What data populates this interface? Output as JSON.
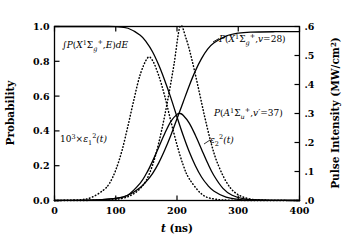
{
  "chart_data": {
    "type": "line",
    "title": "",
    "xlabel": "t (ns)",
    "ylabel": "Probability",
    "y2label": "Pulse Intensity (MW/cm²)",
    "xlim": [
      0,
      400
    ],
    "ylim": [
      0.0,
      1.0
    ],
    "y2lim": [
      0.0,
      0.6
    ],
    "grid": false,
    "legend_position": "inline-annotations",
    "xticks": [
      0,
      100,
      200,
      300,
      400
    ],
    "xticklabels": [
      "0",
      "100",
      "200",
      "300",
      "400"
    ],
    "yticks": [
      0.0,
      0.2,
      0.4,
      0.6,
      0.8,
      1.0
    ],
    "yticklabels": [
      "0.0",
      "0.2",
      "0.4",
      "0.6",
      "0.8",
      "1.0"
    ],
    "y2ticks": [
      0.0,
      0.1,
      0.2,
      0.3,
      0.4,
      0.5,
      0.6
    ],
    "y2ticklabels": [
      ".0",
      ".1",
      ".2",
      ".3",
      ".4",
      ".5",
      ".6"
    ],
    "series": [
      {
        "name": "integral-P-X-E-dE",
        "label_text": "∫P(X¹Σg⁺,E)dE",
        "style": "solid",
        "axis": "left",
        "description": "Starts at 1.0, decays sigmoidally to ~0 near 300 ns",
        "x": [
          0,
          20,
          40,
          60,
          80,
          100,
          120,
          140,
          150,
          160,
          170,
          180,
          190,
          200,
          210,
          220,
          230,
          240,
          250,
          260,
          280,
          300,
          320,
          360,
          400
        ],
        "y": [
          1.0,
          1.0,
          1.0,
          1.0,
          1.0,
          0.999,
          0.99,
          0.95,
          0.91,
          0.855,
          0.78,
          0.69,
          0.59,
          0.48,
          0.375,
          0.28,
          0.2,
          0.135,
          0.088,
          0.055,
          0.019,
          0.007,
          0.003,
          0.001,
          0.0
        ]
      },
      {
        "name": "P-X-v28",
        "label_text": "P(X¹Σg⁺,v=28)",
        "style": "solid",
        "axis": "left",
        "description": "Sigmoidal rise from 0 to ~0.97 plateau after 300 ns",
        "x": [
          0,
          60,
          100,
          120,
          140,
          150,
          160,
          170,
          180,
          190,
          200,
          210,
          220,
          230,
          240,
          250,
          260,
          280,
          300,
          320,
          360,
          400
        ],
        "y": [
          0.0,
          0.002,
          0.012,
          0.03,
          0.075,
          0.11,
          0.155,
          0.215,
          0.29,
          0.375,
          0.47,
          0.565,
          0.66,
          0.745,
          0.815,
          0.87,
          0.905,
          0.945,
          0.962,
          0.968,
          0.97,
          0.97
        ]
      },
      {
        "name": "P-A-v37",
        "label_text": "P(A¹Σᵤ⁺,v'=37)",
        "style": "solid",
        "axis": "left",
        "description": "Transient population: rises to ~0.50 peak near 205 ns then decays to 0",
        "x": [
          0,
          60,
          100,
          120,
          140,
          150,
          160,
          170,
          180,
          190,
          200,
          205,
          210,
          220,
          230,
          240,
          250,
          260,
          275,
          290,
          310,
          340,
          400
        ],
        "y": [
          0.0,
          0.002,
          0.012,
          0.032,
          0.1,
          0.155,
          0.225,
          0.305,
          0.385,
          0.455,
          0.495,
          0.5,
          0.49,
          0.445,
          0.375,
          0.295,
          0.215,
          0.145,
          0.07,
          0.03,
          0.009,
          0.002,
          0.0
        ]
      },
      {
        "name": "epsilon1-squared-pulse",
        "label_text": "10³×ε₁²(t)",
        "style": "dotted",
        "axis": "left",
        "description": "First laser pulse, peak 0.82 at ~152 ns",
        "peak_x": 152,
        "peak_y": 0.82,
        "x": [
          0,
          40,
          60,
          80,
          90,
          100,
          110,
          120,
          130,
          140,
          152,
          160,
          170,
          180,
          190,
          200,
          210,
          220,
          240,
          260,
          300,
          400
        ],
        "y": [
          0.0,
          0.004,
          0.017,
          0.06,
          0.1,
          0.175,
          0.285,
          0.43,
          0.585,
          0.725,
          0.82,
          0.805,
          0.72,
          0.6,
          0.455,
          0.32,
          0.205,
          0.125,
          0.038,
          0.009,
          0.001,
          0.0
        ]
      },
      {
        "name": "epsilon2-squared-pulse",
        "label_text": "ε₂²(t)",
        "style": "dotted",
        "axis": "left",
        "description": "Second laser pulse, peak 1.00 at ~205 ns",
        "peak_x": 205,
        "peak_y": 1.0,
        "x": [
          0,
          80,
          110,
          130,
          145,
          155,
          165,
          175,
          185,
          195,
          205,
          215,
          225,
          235,
          245,
          255,
          265,
          280,
          295,
          315,
          340,
          400
        ],
        "y": [
          0.0,
          0.002,
          0.012,
          0.04,
          0.09,
          0.155,
          0.26,
          0.405,
          0.58,
          0.78,
          1.0,
          0.93,
          0.8,
          0.645,
          0.485,
          0.34,
          0.225,
          0.11,
          0.045,
          0.012,
          0.003,
          0.0
        ]
      }
    ],
    "annotations": [
      {
        "name": "integral-P-X-E-dE",
        "x": 105,
        "y": 0.93
      },
      {
        "name": "P-X-v28",
        "x": 272,
        "y": 0.93
      },
      {
        "name": "P-A-v37",
        "x": 300,
        "y": 0.58
      },
      {
        "name": "epsilon1-squared",
        "x": 72,
        "y": 0.4
      },
      {
        "name": "epsilon2-squared",
        "x": 235,
        "y": 0.38
      }
    ]
  },
  "labels": {
    "ylabel": "Probability",
    "y2label_text": "Pulse Intensity (MW/cm",
    "y2label_sup": "2",
    "y2label_close": ")",
    "xlabel_italic": "t",
    "xlabel_rest": " (ns)"
  },
  "annotation_text": {
    "integral": {
      "integral_sign": "∫",
      "p": "P",
      "paren_open": "(",
      "x": "X",
      "sup1": "1",
      "sigma": "Σ",
      "sub_g": "g",
      "sup_plus": "+",
      "comma": ",",
      "e": "E",
      "paren_close": ")",
      "de_d": "d",
      "de_e": "E"
    },
    "x_v28": {
      "p": "P",
      "paren_open": "(",
      "x": "X",
      "sup1": "1",
      "sigma": "Σ",
      "sub_g": "g",
      "sup_plus": "+",
      "comma": ",",
      "v": "v",
      "eq": "=28",
      "paren_close": ")"
    },
    "a_v37": {
      "p": "P",
      "paren_open": "(",
      "a": "A",
      "sup1": "1",
      "sigma": "Σ",
      "sub_u": "u",
      "sup_plus": "+",
      "comma": ",",
      "v": "v",
      "prime": "′",
      "eq": "=37",
      "paren_close": ")"
    },
    "eps1": {
      "ten": "10",
      "exp": "3",
      "times": "×",
      "eps": "ε",
      "sub": "1",
      "sup": "2",
      "t": "(t)"
    },
    "eps2": {
      "eps": "ε",
      "sub": "2",
      "sup": "2",
      "t": "(t)"
    }
  },
  "style": {
    "line_color": "#000000",
    "background": "#ffffff",
    "axis_color": "#000000"
  }
}
